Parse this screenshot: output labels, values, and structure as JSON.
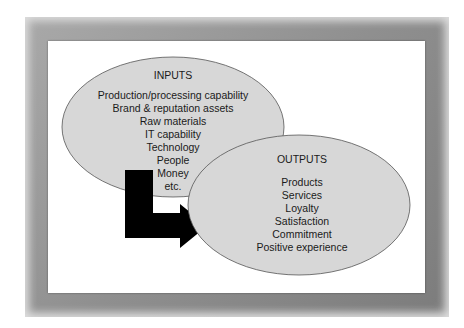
{
  "diagram": {
    "inputs": {
      "title": "INPUTS",
      "items": [
        "Production/processing capability",
        "Brand & reputation assets",
        "Raw materials",
        "IT capability",
        "Technology",
        "People",
        "Money",
        "etc."
      ]
    },
    "outputs": {
      "title": "OUTPUTS",
      "items": [
        "Products",
        "Services",
        "Loyalty",
        "Satisfaction",
        "Commitment",
        "Positive experience"
      ]
    },
    "arrow": {
      "direction": "inputs-to-outputs",
      "color": "#000000"
    },
    "colors": {
      "ellipse_fill": "#d7d7d7",
      "ellipse_stroke": "#555555",
      "frame": "#8f8f8f",
      "background": "#ffffff"
    }
  }
}
